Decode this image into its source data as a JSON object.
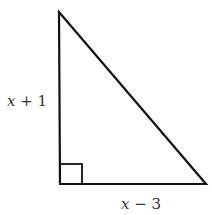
{
  "diagram": {
    "type": "right-triangle",
    "vertices": {
      "top": [
        59,
        12
      ],
      "right_angle": [
        60,
        184
      ],
      "right": [
        206,
        184
      ]
    },
    "right_angle_marker": true,
    "stroke_color": "#111111",
    "labels": {
      "vertical_leg": {
        "variable": "x",
        "rest": " + 1"
      },
      "horizontal_leg": {
        "variable": "x",
        "rest": " − 3"
      }
    }
  }
}
